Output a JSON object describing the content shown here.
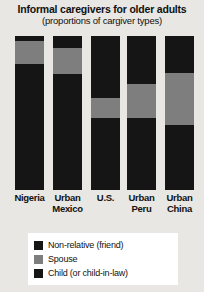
{
  "chart_data": {
    "type": "bar",
    "title": "Informal caregivers for older adults",
    "subtitle": "(proportions of cargiver types)",
    "xlabel": "",
    "ylabel": "",
    "ylim": [
      0,
      100
    ],
    "grid": false,
    "stacked": true,
    "orientation": "vertical",
    "legend_position": "bottom",
    "categories": [
      "Nigeria",
      "Urban Mexico",
      "U.S.",
      "Urban Peru",
      "Urban China"
    ],
    "category_lines": [
      [
        "Nigeria"
      ],
      [
        "Urban",
        "Mexico"
      ],
      [
        "U.S."
      ],
      [
        "Urban",
        "Peru"
      ],
      [
        "Urban",
        "China"
      ]
    ],
    "series": [
      {
        "name": "Non-relative (friend)",
        "color": "#151515",
        "values": [
          3,
          8,
          40,
          31,
          24
        ]
      },
      {
        "name": "Spouse",
        "color": "#7e7e7e",
        "values": [
          15,
          17,
          13,
          22,
          34
        ]
      },
      {
        "name": "Child (or child-in-law)",
        "color": "#151515",
        "values": [
          82,
          75,
          47,
          47,
          42
        ]
      }
    ]
  },
  "legend": {
    "items": [
      {
        "label": "Non-relative (friend)",
        "color": "#151515"
      },
      {
        "label": "Spouse",
        "color": "#7e7e7e"
      },
      {
        "label": "Child (or child-in-law)",
        "color": "#151515"
      }
    ]
  },
  "colors": {
    "background": "#e8e7e3",
    "dark": "#151515",
    "gray": "#7e7e7e",
    "legend_background": "#ffffff",
    "text": "#111111"
  }
}
